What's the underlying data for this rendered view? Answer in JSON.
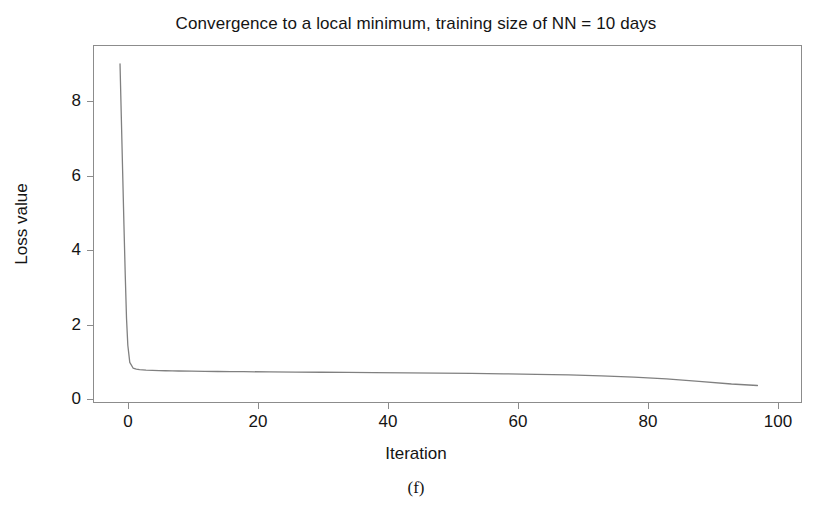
{
  "chart_data": {
    "type": "line",
    "title": "Convergence to a local minimum, training size of NN = 10 days",
    "xlabel": "Iteration",
    "ylabel": "Loss value",
    "caption": "(f)",
    "grid": false,
    "legend": null,
    "xlim": [
      -3,
      106
    ],
    "ylim": [
      -0.45,
      9.6
    ],
    "xticks": [
      0,
      20,
      40,
      60,
      80,
      100
    ],
    "xticklabels": [
      "0",
      "20",
      "40",
      "60",
      "80",
      "100"
    ],
    "yticks": [
      0,
      2,
      4,
      6,
      8
    ],
    "yticklabels": [
      "0",
      "2",
      "4",
      "6",
      "8"
    ],
    "line_color": "#808080",
    "line_width": 1.3,
    "frame_color": "#8c8c8c",
    "background_color": "#ffffff",
    "series": [
      {
        "name": "training loss",
        "x": [
          1,
          1.2,
          1.4,
          1.6,
          1.8,
          2,
          2.2,
          2.5,
          3,
          3.5,
          4,
          5,
          6,
          7,
          8,
          9,
          10,
          12,
          14,
          16,
          18,
          20,
          24,
          28,
          32,
          36,
          40,
          45,
          50,
          55,
          60,
          65,
          70,
          75,
          80,
          85,
          90,
          95,
          99
        ],
        "y": [
          9.1,
          7.6,
          6.1,
          4.6,
          3.2,
          1.95,
          1.2,
          0.72,
          0.56,
          0.53,
          0.515,
          0.5,
          0.492,
          0.487,
          0.483,
          0.479,
          0.476,
          0.471,
          0.467,
          0.463,
          0.46,
          0.457,
          0.451,
          0.446,
          0.441,
          0.436,
          0.431,
          0.424,
          0.416,
          0.407,
          0.396,
          0.383,
          0.366,
          0.341,
          0.305,
          0.253,
          0.186,
          0.112,
          0.07
        ]
      }
    ]
  }
}
